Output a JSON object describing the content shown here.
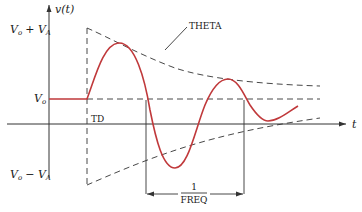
{
  "diagram": {
    "type": "damped-sine-waveform",
    "y_axis_label": "v(t)",
    "x_axis_label": "t",
    "levels": {
      "upper": "V_o + V_A",
      "upper_main": "V",
      "upper_sub1": "o",
      "upper_plus": "+ V",
      "upper_sub2": "A",
      "middle_main": "V",
      "middle_sub": "o",
      "lower_main": "V",
      "lower_sub1": "o",
      "lower_minus": "− V",
      "lower_sub2": "A"
    },
    "annotations": {
      "envelope_label": "THETA",
      "delay_label": "TD",
      "period_numerator": "1",
      "period_denominator": "FREQ"
    },
    "colors": {
      "waveform": "#c0393b",
      "lines": "#333333"
    }
  }
}
